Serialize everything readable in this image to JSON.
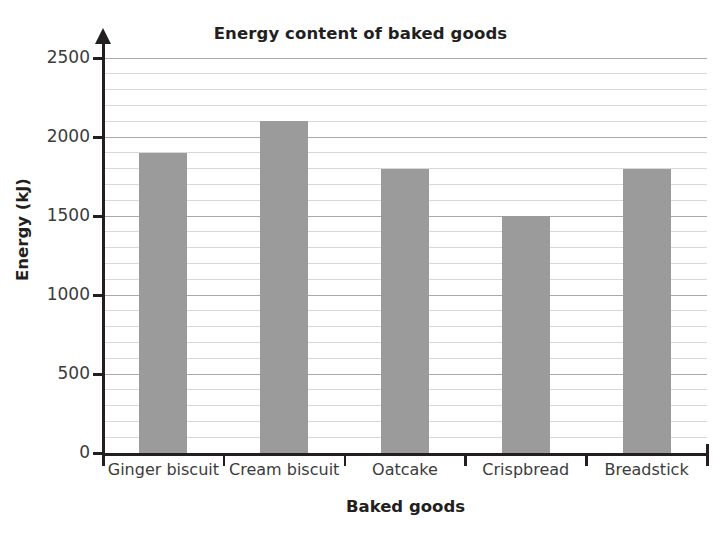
{
  "chart_data": {
    "type": "bar",
    "title": "Energy content of baked goods",
    "xlabel": "Baked goods",
    "ylabel": "Energy (kJ)",
    "categories": [
      "Ginger biscuit",
      "Cream biscuit",
      "Oatcake",
      "Crispbread",
      "Breadstick"
    ],
    "values": [
      1900,
      2100,
      1800,
      1500,
      1800
    ],
    "ylim": [
      0,
      2500
    ],
    "ytick_labels": [
      "0",
      "500",
      "1000",
      "1500",
      "2000",
      "2500"
    ],
    "ytick_values": [
      0,
      500,
      1000,
      1500,
      2000,
      2500
    ],
    "minor_tick_interval": 100,
    "grid": true,
    "legend": false,
    "bar_color": "#9b9b9b",
    "axis_color": "#231f20",
    "gridline_color": "#d8d8d8",
    "major_gridline_color": "#a9a9a9",
    "text_color": "#3b3b3b"
  }
}
